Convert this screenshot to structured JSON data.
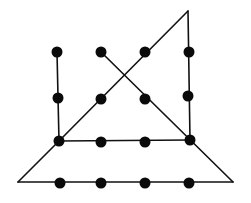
{
  "diagram": {
    "type": "dot-puzzle",
    "line_color": "#111111",
    "dot_color": "#0a0a0a",
    "background": "#ffffff",
    "dots": [
      {
        "id": "r1c1",
        "x": 57,
        "y": 52
      },
      {
        "id": "r1c2",
        "x": 101,
        "y": 52
      },
      {
        "id": "r1c3",
        "x": 145,
        "y": 52
      },
      {
        "id": "r1c4",
        "x": 189,
        "y": 52
      },
      {
        "id": "r2c1",
        "x": 58,
        "y": 98
      },
      {
        "id": "r2c2",
        "x": 101,
        "y": 99
      },
      {
        "id": "r2c3",
        "x": 145,
        "y": 99
      },
      {
        "id": "r2c4",
        "x": 188,
        "y": 96
      },
      {
        "id": "r3c1",
        "x": 59,
        "y": 141
      },
      {
        "id": "r3c2",
        "x": 101,
        "y": 142
      },
      {
        "id": "r3c3",
        "x": 145,
        "y": 142
      },
      {
        "id": "r3c4",
        "x": 190,
        "y": 140
      },
      {
        "id": "r4c1",
        "x": 60,
        "y": 183
      },
      {
        "id": "r4c2",
        "x": 101,
        "y": 183
      },
      {
        "id": "r4c3",
        "x": 145,
        "y": 183
      },
      {
        "id": "r4c4",
        "x": 189,
        "y": 183
      }
    ],
    "segments": [
      {
        "id": "left-vertical",
        "x1": 57,
        "y1": 52,
        "x2": 59,
        "y2": 141
      },
      {
        "id": "rising-diagonal",
        "x1": 59,
        "y1": 141,
        "x2": 188,
        "y2": 11
      },
      {
        "id": "right-vertical",
        "x1": 188,
        "y1": 11,
        "x2": 190,
        "y2": 140
      },
      {
        "id": "middle-horizontal",
        "x1": 190,
        "y1": 140,
        "x2": 59,
        "y2": 141
      },
      {
        "id": "falling-diagonal",
        "x1": 101,
        "y1": 52,
        "x2": 233,
        "y2": 182
      },
      {
        "id": "bottom-horizontal",
        "x1": 233,
        "y1": 182,
        "x2": 18,
        "y2": 182
      },
      {
        "id": "lower-left-diagonal",
        "x1": 18,
        "y1": 182,
        "x2": 59,
        "y2": 141
      }
    ],
    "dot_radius": 5.5,
    "line_width": 1.6
  }
}
